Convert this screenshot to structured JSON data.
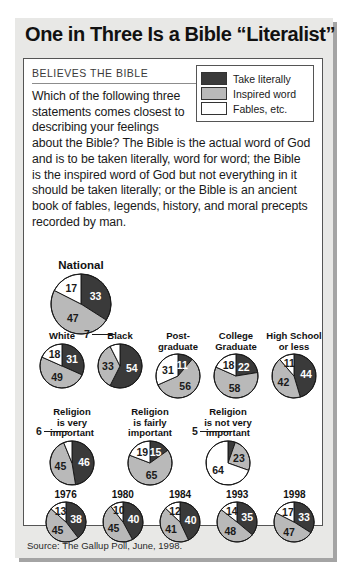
{
  "title": "One in Three Is a Bible “Literalist”",
  "kicker": "BELIEVES THE BIBLE",
  "body_narrow": "Which of the following three statements comes closest to describing your feelings",
  "body_wide": "about the Bible? The Bible is the actual word of God and is to be taken literally, word for word; the Bible is the inspired word of God but not everything in it should be taken literally; or the Bible is an ancient book of fables, legends, history, and moral precepts recorded by man.",
  "source": "Source: The Gallup Poll, June, 1998.",
  "colors": {
    "literal": "#3a3a3a",
    "inspired": "#b9b9b9",
    "fables": "#ffffff",
    "outline": "#1a1a1a",
    "page_bg": "#e8e8e6",
    "panel_bg": "#ffffff"
  },
  "legend": {
    "items": [
      {
        "label": "Take literally",
        "key": "literal"
      },
      {
        "label": "Inspired word",
        "key": "inspired"
      },
      {
        "label": "Fables, etc.",
        "key": "fables"
      }
    ]
  },
  "chart_data": {
    "type": "pie",
    "title": "One in Three Is a Bible “Literalist”",
    "units": "percent",
    "categories": [
      "Take literally",
      "Inspired word",
      "Fables, etc."
    ],
    "category_colors": [
      "#3a3a3a",
      "#b9b9b9",
      "#ffffff"
    ],
    "groups": [
      {
        "row": "national",
        "charts": [
          {
            "label": "National",
            "size": 62,
            "values": {
              "literal": 33,
              "inspired": 47,
              "fables": 17
            }
          }
        ]
      },
      {
        "row": "race_education",
        "charts": [
          {
            "label": "White",
            "size": 46,
            "values": {
              "literal": 31,
              "inspired": 49,
              "fables": 18
            }
          },
          {
            "label": "Black",
            "size": 46,
            "values": {
              "literal": 54,
              "inspired": 33,
              "fables": 7
            },
            "leader": "fables"
          },
          {
            "label": "Post-\ngraduate",
            "size": 46,
            "values": {
              "literal": 11,
              "inspired": 56,
              "fables": 31
            }
          },
          {
            "label": "College\nGraduate",
            "size": 46,
            "values": {
              "literal": 22,
              "inspired": 58,
              "fables": 18
            }
          },
          {
            "label": "High School\nor less",
            "size": 46,
            "values": {
              "literal": 44,
              "inspired": 42,
              "fables": 11
            }
          }
        ]
      },
      {
        "row": "religion_importance",
        "charts": [
          {
            "label": "Religion\nis very\nimportant",
            "size": 46,
            "values": {
              "literal": 46,
              "inspired": 45,
              "fables": 6
            },
            "leader": "fables"
          },
          {
            "label": "Religion\nis fairly\nimportant",
            "size": 46,
            "values": {
              "literal": 15,
              "inspired": 65,
              "fables": 19
            }
          },
          {
            "label": "Religion\nis not very\nimportant",
            "size": 46,
            "values": {
              "literal": 5,
              "inspired": 23,
              "fables": 64
            },
            "leader": "literal"
          }
        ]
      },
      {
        "row": "trend_years",
        "charts": [
          {
            "label": "1976",
            "size": 42,
            "values": {
              "literal": 38,
              "inspired": 45,
              "fables": 13
            }
          },
          {
            "label": "1980",
            "size": 42,
            "values": {
              "literal": 40,
              "inspired": 45,
              "fables": 10
            }
          },
          {
            "label": "1984",
            "size": 42,
            "values": {
              "literal": 40,
              "inspired": 41,
              "fables": 12
            }
          },
          {
            "label": "1993",
            "size": 42,
            "values": {
              "literal": 35,
              "inspired": 48,
              "fables": 14
            }
          },
          {
            "label": "1998",
            "size": 42,
            "values": {
              "literal": 33,
              "inspired": 47,
              "fables": 17
            }
          }
        ]
      }
    ]
  }
}
